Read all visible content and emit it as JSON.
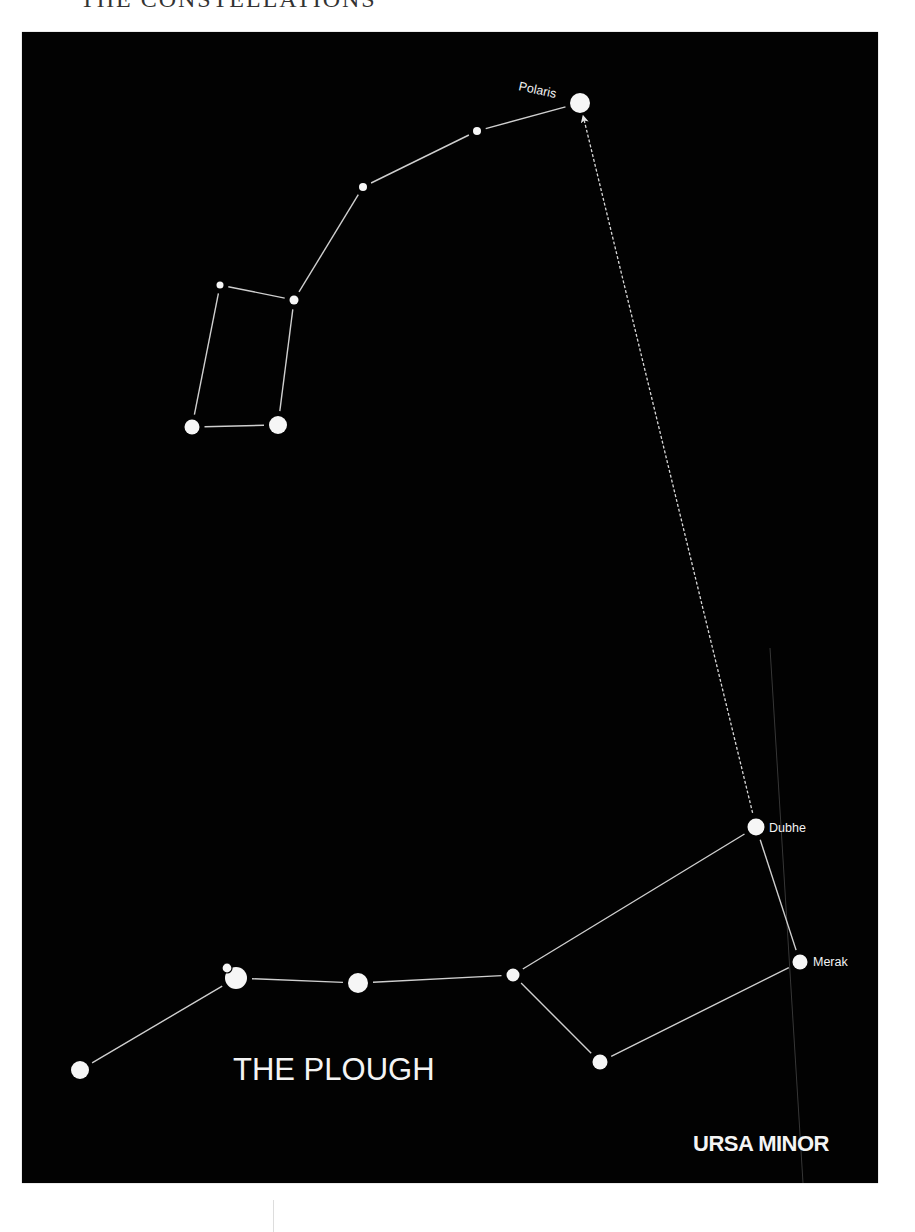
{
  "page": {
    "heading": "THE CONSTELLATIONS"
  },
  "colors": {
    "background": "#ffffff",
    "sky": "#020202",
    "star": "#f6f6f6",
    "line": "#cfcfcf"
  },
  "diagram": {
    "title": "THE PLOUGH",
    "subtitle": "URSA MINOR",
    "labels": {
      "polaris": "Polaris",
      "dubhe": "Dubhe",
      "merak": "Merak"
    },
    "stars": {
      "polaris": {
        "name": "Polaris",
        "x": 580,
        "y": 103,
        "r": 10
      },
      "um2": {
        "name": "",
        "x": 477,
        "y": 131,
        "r": 4
      },
      "um3": {
        "name": "",
        "x": 363,
        "y": 187,
        "r": 4
      },
      "um4": {
        "name": "",
        "x": 294,
        "y": 300,
        "r": 4.5
      },
      "um5": {
        "name": "",
        "x": 220,
        "y": 285,
        "r": 3.5
      },
      "um6": {
        "name": "",
        "x": 192,
        "y": 427,
        "r": 7.5
      },
      "um7": {
        "name": "",
        "x": 278,
        "y": 425,
        "r": 9
      },
      "dubhe": {
        "name": "Dubhe",
        "x": 756,
        "y": 827,
        "r": 8.5
      },
      "merak": {
        "name": "Merak",
        "x": 800,
        "y": 962,
        "r": 7.5
      },
      "phecda": {
        "name": "",
        "x": 600,
        "y": 1062,
        "r": 7.5
      },
      "megrez": {
        "name": "",
        "x": 513,
        "y": 975,
        "r": 6.5
      },
      "alioth": {
        "name": "",
        "x": 358,
        "y": 983,
        "r": 10
      },
      "mizar": {
        "name": "",
        "x": 236,
        "y": 978,
        "r": 11
      },
      "alcor": {
        "name": "",
        "x": 227,
        "y": 968,
        "r": 5
      },
      "alkaid": {
        "name": "",
        "x": 80,
        "y": 1070,
        "r": 9
      }
    },
    "ursa_minor_lines": [
      [
        "polaris",
        "um2"
      ],
      [
        "um2",
        "um3"
      ],
      [
        "um3",
        "um4"
      ],
      [
        "um4",
        "um5"
      ],
      [
        "um5",
        "um6"
      ],
      [
        "um6",
        "um7"
      ],
      [
        "um7",
        "um4"
      ]
    ],
    "plough_lines": [
      [
        "alkaid",
        "mizar"
      ],
      [
        "mizar",
        "alioth"
      ],
      [
        "alioth",
        "megrez"
      ],
      [
        "megrez",
        "dubhe"
      ],
      [
        "dubhe",
        "merak"
      ],
      [
        "merak",
        "phecda"
      ],
      [
        "phecda",
        "megrez"
      ]
    ],
    "pointer": {
      "from": "dubhe",
      "to": "polaris",
      "style": "dashed-arrow"
    }
  }
}
